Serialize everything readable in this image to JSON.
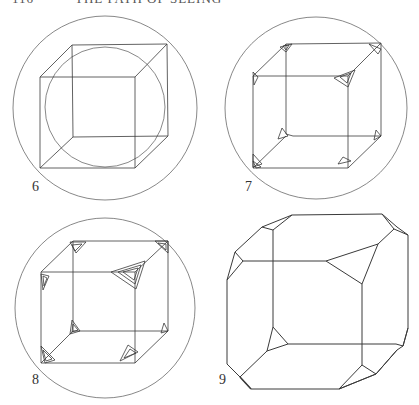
{
  "page": {
    "running_head": {
      "page_number": "116",
      "title": "THE PATH OF SEEING"
    }
  },
  "figures": [
    {
      "label": "6",
      "description": "Cube inscribed in outer circle with inner circle inscribed"
    },
    {
      "label": "7",
      "description": "Cube in circle with small triangular truncations at corners"
    },
    {
      "label": "8",
      "description": "Cube in circle with larger nested triangular truncations at corners"
    },
    {
      "label": "9",
      "description": "Truncated cube (polyhedron) with triangular corner faces"
    }
  ],
  "colors": {
    "stroke": "#3a3a3a",
    "circle": "#6a6a6a",
    "background": "#ffffff"
  }
}
